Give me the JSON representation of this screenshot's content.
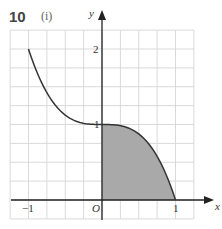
{
  "question": {
    "number": "10",
    "part": "(i)"
  },
  "colors": {
    "grid": "#d9d9d9",
    "axis": "#222222",
    "curve": "#333333",
    "shade": "#a9a9a9"
  },
  "chart_data": {
    "type": "line",
    "title": "",
    "function": "y = 1 - x^3",
    "xlabel": "x",
    "ylabel": "y",
    "xlim": [
      -1.25,
      1.25
    ],
    "ylim": [
      -0.25,
      2.25
    ],
    "grid": true,
    "grid_step": 0.25,
    "x_ticks": [
      {
        "value": -1,
        "label": "-1"
      },
      {
        "value": 1,
        "label": "1"
      }
    ],
    "y_ticks": [
      {
        "value": 1,
        "label": "1"
      },
      {
        "value": 2,
        "label": "2"
      }
    ],
    "origin_label": "O",
    "series": [
      {
        "name": "curve",
        "x": [
          -1,
          -0.75,
          -0.5,
          -0.25,
          0,
          0.25,
          0.5,
          0.75,
          1
        ],
        "y": [
          2,
          1.42,
          1.125,
          1.016,
          1,
          0.984,
          0.875,
          0.578,
          0
        ]
      }
    ],
    "shaded_region": {
      "description": "area under curve from x=0 to x=1",
      "x_from": 0,
      "x_to": 1
    }
  },
  "labels": {
    "x_axis": "x",
    "y_axis": "y",
    "origin": "O",
    "x_neg1": "−1",
    "x_1": "1",
    "y_1": "1",
    "y_2": "2"
  }
}
